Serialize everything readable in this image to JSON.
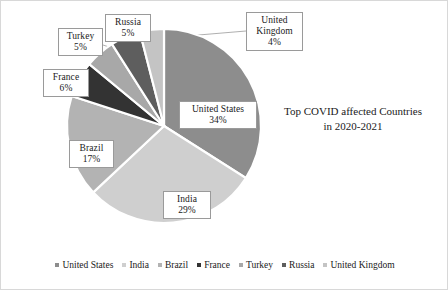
{
  "chart_data": {
    "type": "pie",
    "title": "Top COVID affected Countries in 2020-2021",
    "title_line1": "Top COVID affected Countries",
    "title_line2": "in 2020-2021",
    "categories": [
      "United States",
      "India",
      "Brazil",
      "France",
      "Turkey",
      "Russia",
      "United Kingdom"
    ],
    "values": [
      34,
      29,
      17,
      6,
      5,
      5,
      4
    ],
    "value_suffix": "%",
    "colors": [
      "#8d8d8d",
      "#cfcfcf",
      "#b3b3b3",
      "#333333",
      "#a8a8a8",
      "#5e5e5e",
      "#c4c4c4"
    ],
    "start_angle_deg": 0,
    "direction": "clockwise",
    "legend_position": "bottom",
    "grid": false,
    "slices": [
      {
        "label": "United States",
        "value": 34,
        "display": "34%",
        "color": "#8d8d8d"
      },
      {
        "label": "India",
        "value": 29,
        "display": "29%",
        "color": "#cfcfcf"
      },
      {
        "label": "Brazil",
        "value": 17,
        "display": "17%",
        "color": "#b3b3b3"
      },
      {
        "label": "France",
        "value": 6,
        "display": "6%",
        "color": "#333333"
      },
      {
        "label": "Turkey",
        "value": 5,
        "display": "5%",
        "color": "#a8a8a8"
      },
      {
        "label": "Russia",
        "value": 5,
        "display": "5%",
        "color": "#5e5e5e"
      },
      {
        "label": "United Kingdom",
        "value": 4,
        "display": "4%",
        "color": "#c4c4c4"
      }
    ]
  },
  "callouts": {
    "united_states": {
      "name": "United States",
      "value": "34%"
    },
    "india": {
      "name": "India",
      "value": "29%"
    },
    "brazil": {
      "name": "Brazil",
      "value": "17%"
    },
    "france": {
      "name": "France",
      "value": "6%"
    },
    "turkey": {
      "name": "Turkey",
      "value": "5%"
    },
    "russia": {
      "name": "Russia",
      "value": "5%"
    },
    "united_kingdom": {
      "name_line1": "United",
      "name_line2": "Kingdom",
      "value": "4%"
    }
  },
  "legend": {
    "items": [
      {
        "label": "United States",
        "color": "#8d8d8d"
      },
      {
        "label": "India",
        "color": "#cfcfcf"
      },
      {
        "label": "Brazil",
        "color": "#b3b3b3"
      },
      {
        "label": "France",
        "color": "#333333"
      },
      {
        "label": "Turkey",
        "color": "#a8a8a8"
      },
      {
        "label": "Russia",
        "color": "#5e5e5e"
      },
      {
        "label": "United Kingdom",
        "color": "#c4c4c4"
      }
    ]
  }
}
